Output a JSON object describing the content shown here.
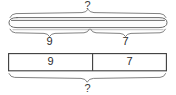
{
  "diagram": {
    "type": "bar-model",
    "title": "",
    "top_model": {
      "total_label": "?",
      "parts": [
        {
          "label": "9",
          "value": 9
        },
        {
          "label": "7",
          "value": 7
        }
      ]
    },
    "bottom_model": {
      "total_label": "?",
      "cells": [
        {
          "label": "9",
          "value": 9
        },
        {
          "label": "7",
          "value": 7
        }
      ]
    },
    "colors": {
      "line": "#5a5a5a",
      "box_line": "#3c3c3c",
      "text": "#2b2b2b",
      "background": "#ffffff"
    }
  }
}
